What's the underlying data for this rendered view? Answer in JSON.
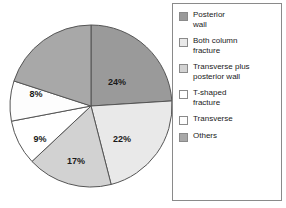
{
  "chart_data": {
    "type": "pie",
    "title": "",
    "subtitle": "",
    "xlabel": "",
    "ylabel": "",
    "legend_position": "right",
    "grid": false,
    "categories": [
      "Posterior wall",
      "Both column fracture",
      "Transverse plus posterior wall",
      "T-shaped fracture",
      "Transverse",
      "Others"
    ],
    "values": [
      24,
      22,
      17,
      9,
      8,
      20
    ],
    "value_labels": [
      "24%",
      "22%",
      "17%",
      "9%",
      "8%",
      ""
    ],
    "units": "percent",
    "total": 100,
    "start_angle_deg": 0,
    "direction": "clockwise",
    "slice_colors": [
      "#9a9a9a",
      "#e9e9e9",
      "#d2d2d2",
      "#ffffff",
      "#fdfdfd",
      "#a8a8a8"
    ],
    "slices": [
      {
        "label": "Posterior wall",
        "value": 24,
        "value_label": "24%",
        "color": "#9a9a9a",
        "start_deg": 0,
        "sweep_deg": 86.4
      },
      {
        "label": "Both column fracture",
        "value": 22,
        "value_label": "22%",
        "color": "#e9e9e9",
        "start_deg": 86.4,
        "sweep_deg": 79.2
      },
      {
        "label": "Transverse plus posterior wall",
        "value": 17,
        "value_label": "17%",
        "color": "#d2d2d2",
        "start_deg": 165.6,
        "sweep_deg": 61.2
      },
      {
        "label": "T-shaped fracture",
        "value": 9,
        "value_label": "9%",
        "color": "#ffffff",
        "start_deg": 226.8,
        "sweep_deg": 32.4
      },
      {
        "label": "Transverse",
        "value": 8,
        "value_label": "8%",
        "color": "#fdfdfd",
        "start_deg": 259.2,
        "sweep_deg": 28.8
      },
      {
        "label": "Others",
        "value": 20,
        "value_label": "",
        "color": "#a8a8a8",
        "start_deg": 288.0,
        "sweep_deg": 72.0
      }
    ]
  },
  "pie": {
    "center_x": 91,
    "center_y": 106,
    "radius": 81,
    "outline_color": "#555555",
    "labels": [
      {
        "text": "24%",
        "x": 117,
        "y": 83
      },
      {
        "text": "22%",
        "x": 122,
        "y": 140
      },
      {
        "text": "17%",
        "x": 76,
        "y": 162
      },
      {
        "text": "9%",
        "x": 40,
        "y": 140
      },
      {
        "text": "8%",
        "x": 36,
        "y": 95
      }
    ]
  },
  "legend": {
    "items": [
      {
        "label": "Posterior\nwall",
        "color": "#9a9a9a"
      },
      {
        "label": "Both column\nfracture",
        "color": "#e9e9e9"
      },
      {
        "label": "Transverse plus\nposterior wall",
        "color": "#d2d2d2"
      },
      {
        "label": "T-shaped\nfracture",
        "color": "#ffffff"
      },
      {
        "label": "Transverse",
        "color": "#fdfdfd"
      },
      {
        "label": "Others",
        "color": "#a8a8a8"
      }
    ]
  }
}
